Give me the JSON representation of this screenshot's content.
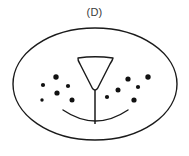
{
  "figure": {
    "panel_label": "(D)",
    "type": "line-art schematic diagram",
    "background_color": "#ffffff",
    "stroke_color": "#1a1a1a",
    "dot_color": "#111111",
    "label_color": "#3a3a3a",
    "canvas": {
      "width": 189,
      "height": 156
    }
  },
  "outline": {
    "name": "outer-ellipse",
    "shape": "ellipse",
    "center_x": 95,
    "center_y": 84,
    "radius_x": 82,
    "radius_y": 56,
    "stroke_width": 1.4,
    "fill": "none"
  },
  "central_structure": {
    "name": "funnel-shape",
    "shape": "inverted-triangle-with-stem",
    "top_left_x": 77,
    "top_right_x": 114,
    "top_y": 58,
    "apex_x": 95,
    "apex_y": 91,
    "stem_top_y": 91,
    "stem_bottom_y": 124,
    "stroke_width": 1.4,
    "fill": "none"
  },
  "arc": {
    "name": "lower-arc",
    "shape": "open-downward-curve",
    "left_x": 63,
    "left_y": 110,
    "right_x": 128,
    "right_y": 110,
    "dip_y": 121,
    "stroke_width": 1.4
  },
  "dot_clusters": [
    {
      "name": "left-dot-cluster",
      "count": 6,
      "dots": [
        {
          "cx": 56,
          "cy": 77,
          "r": 2.7
        },
        {
          "cx": 43,
          "cy": 85,
          "r": 2.1
        },
        {
          "cx": 68,
          "cy": 86,
          "r": 2.1
        },
        {
          "cx": 57,
          "cy": 93,
          "r": 2.6
        },
        {
          "cx": 42,
          "cy": 100,
          "r": 1.7
        },
        {
          "cx": 72,
          "cy": 100,
          "r": 2.5
        }
      ]
    },
    {
      "name": "right-dot-cluster",
      "count": 6,
      "dots": [
        {
          "cx": 128,
          "cy": 79,
          "r": 2.6
        },
        {
          "cx": 148,
          "cy": 77,
          "r": 2.7
        },
        {
          "cx": 118,
          "cy": 90,
          "r": 2.5
        },
        {
          "cx": 138,
          "cy": 87,
          "r": 2.1
        },
        {
          "cx": 107,
          "cy": 97,
          "r": 2.1
        },
        {
          "cx": 134,
          "cy": 100,
          "r": 2.6
        }
      ]
    }
  ]
}
